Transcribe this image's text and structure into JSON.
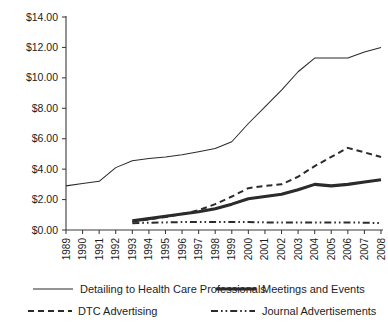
{
  "chart_data": {
    "type": "line",
    "title": "",
    "xlabel": "",
    "ylabel": "",
    "grid": false,
    "legend_position": "bottom",
    "ylim": [
      0,
      14
    ],
    "ytick_labels": [
      "$0.00",
      "$2.00",
      "$4.00",
      "$6.00",
      "$8.00",
      "$10.00",
      "$12.00",
      "$14.00"
    ],
    "ytick_values": [
      0,
      2,
      4,
      6,
      8,
      10,
      12,
      14
    ],
    "categories": [
      "1989",
      "1990",
      "1991",
      "1992",
      "1993",
      "1994",
      "1995",
      "1996",
      "1997",
      "1998",
      "1999",
      "2000",
      "2001",
      "2002",
      "2003",
      "2004",
      "2005",
      "2006",
      "2007",
      "2008"
    ],
    "x": [
      1989,
      1990,
      1991,
      1992,
      1993,
      1994,
      1995,
      1996,
      1997,
      1998,
      1999,
      2000,
      2001,
      2002,
      2003,
      2004,
      2005,
      2006,
      2007,
      2008
    ],
    "series": [
      {
        "name": "Detailing to Health Care Professionals",
        "style": "thin-solid",
        "values": [
          2.9,
          3.05,
          3.2,
          4.1,
          4.55,
          4.7,
          4.8,
          4.95,
          5.15,
          5.35,
          5.8,
          7.0,
          8.1,
          9.2,
          10.4,
          11.3,
          11.3,
          11.3,
          11.7,
          12.0
        ]
      },
      {
        "name": "Meetings and Events",
        "style": "thick-solid",
        "values": [
          null,
          null,
          null,
          null,
          0.6,
          0.75,
          0.9,
          1.05,
          1.2,
          1.4,
          1.7,
          2.05,
          2.2,
          2.35,
          2.65,
          3.0,
          2.9,
          3.0,
          3.15,
          3.3
        ]
      },
      {
        "name": "DTC Advertising",
        "style": "dashed",
        "values": [
          null,
          null,
          null,
          null,
          0.55,
          0.7,
          0.85,
          1.05,
          1.3,
          1.7,
          2.2,
          2.75,
          2.9,
          3.0,
          3.5,
          4.2,
          4.8,
          5.4,
          5.1,
          4.8
        ]
      },
      {
        "name": "Journal Advertisements",
        "style": "dash-dot-dot",
        "values": [
          null,
          null,
          null,
          null,
          0.45,
          0.48,
          0.5,
          0.52,
          0.52,
          0.52,
          0.52,
          0.52,
          0.5,
          0.5,
          0.5,
          0.5,
          0.5,
          0.5,
          0.48,
          0.45
        ]
      }
    ]
  },
  "legend": {
    "items": [
      {
        "label": "Detailing to Health Care Professionals",
        "style": "thin-solid"
      },
      {
        "label": "Meetings and Events",
        "style": "thick-solid"
      },
      {
        "label": "DTC Advertising",
        "style": "dashed"
      },
      {
        "label": "Journal Advertisements",
        "style": "dash-dot-dot"
      }
    ]
  },
  "colors": {
    "line": "#2b2b2b",
    "axis": "#3a3a3a",
    "text": "#1d1d1d",
    "background": "#ffffff"
  }
}
